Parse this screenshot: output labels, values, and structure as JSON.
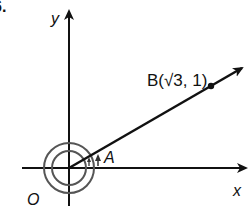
{
  "figure": {
    "number_label": "6.",
    "axes": {
      "x_label": "x",
      "y_label": "y",
      "origin_label": "O"
    },
    "point": {
      "label": "B(√3, 1)",
      "name": "B",
      "coordinates": "(√3, 1)"
    },
    "angle_label": "A",
    "colors": {
      "stroke": "#111111",
      "circles": "#555555",
      "background": "#ffffff"
    }
  }
}
